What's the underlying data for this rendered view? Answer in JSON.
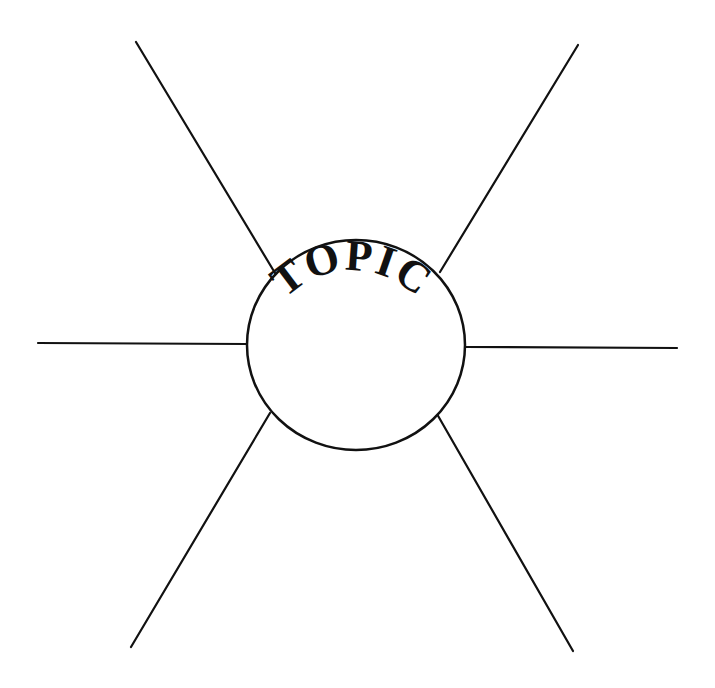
{
  "diagram": {
    "type": "spider-map",
    "center": {
      "label": "TOPIC",
      "cx": 356,
      "cy": 345,
      "rx": 109,
      "ry": 105
    },
    "spokes": [
      {
        "name": "spoke-top-left",
        "x1": 136,
        "y1": 42,
        "x2": 275,
        "y2": 273
      },
      {
        "name": "spoke-top-right",
        "x1": 578,
        "y1": 45,
        "x2": 440,
        "y2": 272
      },
      {
        "name": "spoke-left",
        "x1": 38,
        "y1": 343,
        "x2": 247,
        "y2": 344
      },
      {
        "name": "spoke-right",
        "x1": 466,
        "y1": 347,
        "x2": 677,
        "y2": 348
      },
      {
        "name": "spoke-bottom-left",
        "x1": 270,
        "y1": 413,
        "x2": 131,
        "y2": 647
      },
      {
        "name": "spoke-bottom-right",
        "x1": 437,
        "y1": 414,
        "x2": 573,
        "y2": 651
      }
    ],
    "colors": {
      "stroke": "#111111",
      "background": "#ffffff"
    }
  }
}
